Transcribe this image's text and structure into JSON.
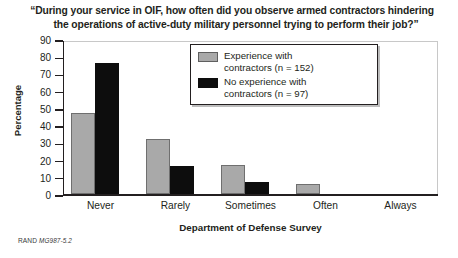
{
  "chart_data": {
    "type": "bar",
    "title": "“During your service in OIF, how often did you observe armed contractors hindering the operations of active-duty military personnel trying to perform their job?”",
    "title_line1": "“During your service in OIF, how often did you observe armed contractors hindering",
    "title_line2": "the operations of active-duty military personnel trying to perform their job?”",
    "xlabel": "Department of Defense Survey",
    "ylabel": "Percentage",
    "categories": [
      "Never",
      "Rarely",
      "Sometimes",
      "Often",
      "Always"
    ],
    "ylim": [
      0,
      90
    ],
    "yticks": [
      0,
      10,
      20,
      30,
      40,
      50,
      60,
      70,
      80,
      90
    ],
    "ytick_labels": [
      "0",
      "10",
      "20",
      "30",
      "40",
      "50",
      "60",
      "70",
      "80",
      "90"
    ],
    "grid": false,
    "legend_position": "upper-center",
    "series": [
      {
        "name": "Experience with contractors (n = 152)",
        "label_line1": "Experience with",
        "label_line2": "contractors (n = 152)",
        "color": "#a9a9a9",
        "values": [
          47,
          32,
          17,
          6,
          0
        ]
      },
      {
        "name": "No experience with contractors (n = 97)",
        "label_line1": "No experience with",
        "label_line2": "contractors (n = 97)",
        "color": "#0d0d0d",
        "values": [
          76,
          16,
          7,
          0,
          0
        ]
      }
    ]
  },
  "footer": {
    "source": "RAND",
    "figure_id": "MG987-5.2"
  }
}
